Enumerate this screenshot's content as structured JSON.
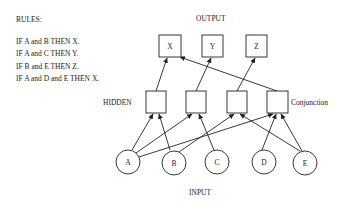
{
  "rules": {
    "title": "RULES:",
    "items": [
      "IF A and B THEN X.",
      "IF A and C THEN Y.",
      "IF B and E THEN Z.",
      "IF A and D and E THEN X."
    ]
  },
  "layers": {
    "output_label": "OUTPUT",
    "hidden_label": "HIDDEN",
    "hidden_annotation": "Conjunction",
    "input_label": "INPUT"
  },
  "nodes": {
    "outputs": [
      "X",
      "Y",
      "Z"
    ],
    "hidden": [
      "",
      "",
      "",
      ""
    ],
    "inputs": [
      "A",
      "B",
      "C",
      "D",
      "E"
    ]
  },
  "edges": {
    "input_to_hidden": [
      {
        "from": "A",
        "to": "H1"
      },
      {
        "from": "B",
        "to": "H1"
      },
      {
        "from": "A",
        "to": "H2"
      },
      {
        "from": "C",
        "to": "H2"
      },
      {
        "from": "B",
        "to": "H3"
      },
      {
        "from": "E",
        "to": "H3"
      },
      {
        "from": "A",
        "to": "H4"
      },
      {
        "from": "D",
        "to": "H4"
      },
      {
        "from": "E",
        "to": "H4"
      }
    ],
    "hidden_to_output": [
      {
        "from": "H1",
        "to": "X"
      },
      {
        "from": "H2",
        "to": "Y"
      },
      {
        "from": "H3",
        "to": "Z"
      },
      {
        "from": "H4",
        "to": "X"
      }
    ]
  }
}
